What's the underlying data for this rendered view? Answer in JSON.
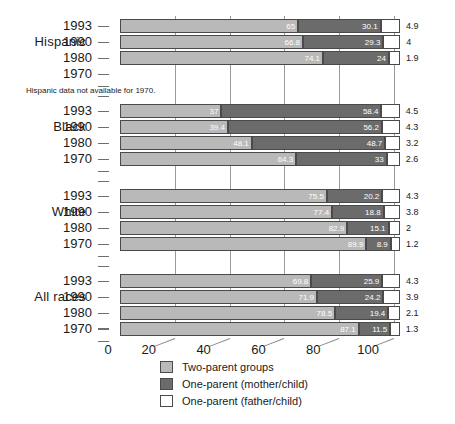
{
  "chart_data": {
    "type": "bar",
    "orientation": "horizontal",
    "stacked": true,
    "title": "",
    "xlabel": "",
    "ylabel": "",
    "xlim": [
      0,
      108
    ],
    "xticks": [
      0,
      20,
      40,
      60,
      80,
      100
    ],
    "xtick_labels": [
      "0",
      "20",
      "40",
      "60",
      "80",
      "100"
    ],
    "grid": true,
    "legend_position": "bottom-center",
    "note": "Hispanic data not available for 1970.",
    "series": [
      {
        "name": "Two-parent groups",
        "key": "two",
        "color": "#b9b9b9"
      },
      {
        "name": "One-parent (mother/child)",
        "key": "mother",
        "color": "#6b6b6b"
      },
      {
        "name": "One-parent (father/child)",
        "key": "father",
        "color": "#ffffff"
      }
    ],
    "groups": [
      {
        "label": "Hispanic",
        "rows": [
          {
            "year": "1993",
            "two": 65,
            "mother": 30.1,
            "father": 4.9,
            "two_label": "65",
            "mother_label": "30.1",
            "father_label": "4.9"
          },
          {
            "year": "1990",
            "two": 66.8,
            "mother": 29.3,
            "father": 4,
            "two_label": "66.8",
            "mother_label": "29.3",
            "father_label": "4"
          },
          {
            "year": "1980",
            "two": 74.1,
            "mother": 24,
            "father": 1.9,
            "two_label": "74.1",
            "mother_label": "24",
            "father_label": "1.9"
          },
          {
            "year": "1970",
            "two": null,
            "mother": null,
            "father": null,
            "two_label": "",
            "mother_label": "",
            "father_label": ""
          }
        ]
      },
      {
        "label": "Black",
        "rows": [
          {
            "year": "1993",
            "two": 37,
            "mother": 58.4,
            "father": 4.5,
            "two_label": "37",
            "mother_label": "58.4",
            "father_label": "4.5"
          },
          {
            "year": "1990",
            "two": 39.4,
            "mother": 56.2,
            "father": 4.3,
            "two_label": "39.4",
            "mother_label": "56.2",
            "father_label": "4.3"
          },
          {
            "year": "1980",
            "two": 48.1,
            "mother": 48.7,
            "father": 3.2,
            "two_label": "48.1",
            "mother_label": "48.7",
            "father_label": "3.2"
          },
          {
            "year": "1970",
            "two": 64.3,
            "mother": 33,
            "father": 2.6,
            "two_label": "64.3",
            "mother_label": "33",
            "father_label": "2.6"
          }
        ]
      },
      {
        "label": "White",
        "rows": [
          {
            "year": "1993",
            "two": 75.5,
            "mother": 20.2,
            "father": 4.3,
            "two_label": "75.5",
            "mother_label": "20.2",
            "father_label": "4.3"
          },
          {
            "year": "1990",
            "two": 77.4,
            "mother": 18.8,
            "father": 3.8,
            "two_label": "77.4",
            "mother_label": "18.8",
            "father_label": "3.8"
          },
          {
            "year": "1980",
            "two": 82.9,
            "mother": 15.1,
            "father": 2,
            "two_label": "82.9",
            "mother_label": "15.1",
            "father_label": "2"
          },
          {
            "year": "1970",
            "two": 89.9,
            "mother": 8.9,
            "father": 1.2,
            "two_label": "89.9",
            "mother_label": "8.9",
            "father_label": "1.2"
          }
        ]
      },
      {
        "label": "All races",
        "rows": [
          {
            "year": "1993",
            "two": 69.8,
            "mother": 25.9,
            "father": 4.3,
            "two_label": "69.8",
            "mother_label": "25.9",
            "father_label": "4.3"
          },
          {
            "year": "1990",
            "two": 71.9,
            "mother": 24.2,
            "father": 3.9,
            "two_label": "71.9",
            "mother_label": "24.2",
            "father_label": "3.9"
          },
          {
            "year": "1980",
            "two": 78.5,
            "mother": 19.4,
            "father": 2.1,
            "two_label": "78.5",
            "mother_label": "19.4",
            "father_label": "2.1"
          },
          {
            "year": "1970",
            "two": 87.1,
            "mother": 11.5,
            "father": 1.3,
            "two_label": "87.1",
            "mother_label": "11.5",
            "father_label": "1.3"
          }
        ]
      }
    ]
  }
}
